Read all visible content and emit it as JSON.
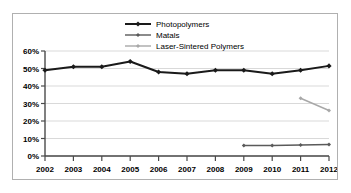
{
  "chart_data": {
    "type": "line",
    "title": "",
    "xlabel": "",
    "ylabel": "",
    "categories": [
      "2002",
      "2003",
      "2004",
      "2005",
      "2006",
      "2007",
      "2008",
      "2009",
      "2010",
      "2011",
      "2012"
    ],
    "ylim": [
      0,
      60
    ],
    "ytick_labels": [
      "0%",
      "10%",
      "20%",
      "30%",
      "40%",
      "50%",
      "60%"
    ],
    "ytick_values": [
      0,
      10,
      20,
      30,
      40,
      50,
      60
    ],
    "grid": "horizontal",
    "legend_position": "top-center",
    "series": [
      {
        "name": "Photopolymers",
        "color": "#1a1a1a",
        "marker": "diamond",
        "values": [
          49,
          51,
          51,
          54,
          48,
          47,
          49,
          49,
          47,
          49,
          51.5
        ]
      },
      {
        "name": "Matals",
        "color": "#5a5a5a",
        "marker": "diamond",
        "values": [
          null,
          null,
          null,
          null,
          null,
          null,
          null,
          6,
          6,
          6.3,
          6.6
        ]
      },
      {
        "name": "Laser-Sintered Polymers",
        "color": "#a8a8a8",
        "marker": "diamond",
        "values": [
          null,
          null,
          null,
          null,
          null,
          null,
          null,
          null,
          null,
          33,
          26
        ]
      }
    ]
  },
  "style": {
    "frame_border": "#b0b0b0",
    "grid_color": "#d9d9d9",
    "axis_color": "#4a4a4a",
    "background": "#ffffff"
  }
}
